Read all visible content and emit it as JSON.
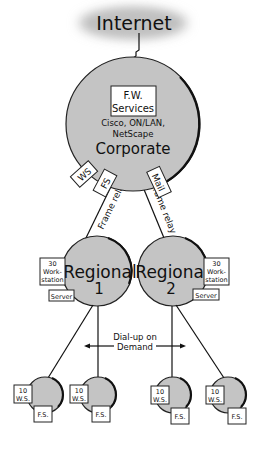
{
  "diagram": {
    "type": "network-topology",
    "colors": {
      "node_fill": "#c4c4c4",
      "cloud_fill": "#bdbdbd",
      "line": "#111111",
      "box_fill": "#ffffff"
    },
    "internet": {
      "label": "Internet"
    },
    "corporate": {
      "title": "Corporate",
      "fw_box": {
        "line1": "F.W.",
        "line2": "Services"
      },
      "vendors_line1": "Cisco, ON/LAN,",
      "vendors_line2": "NetScape",
      "tags": [
        {
          "label": "WS"
        },
        {
          "label": "FS"
        },
        {
          "label": "Mail"
        }
      ]
    },
    "links": {
      "left": {
        "label": "Frame relay"
      },
      "right": {
        "label": "Frame relay"
      }
    },
    "regionals": [
      {
        "title": "Regional",
        "number": "1",
        "ws_box": {
          "line1": "30",
          "line2": "Work-",
          "line3": "station"
        },
        "server_box": {
          "label": "Server"
        }
      },
      {
        "title": "Regional",
        "number": "2",
        "ws_box": {
          "line1": "30",
          "line2": "Work-",
          "line3": "station"
        },
        "server_box": {
          "label": "Server"
        }
      }
    ],
    "dialup": {
      "line1": "Dial-up on",
      "line2": "Demand"
    },
    "branches": [
      {
        "ws_line1": "10",
        "ws_line2": "W.S.",
        "fs_label": "F.S."
      },
      {
        "ws_line1": "10",
        "ws_line2": "W.S.",
        "fs_label": "F.S."
      },
      {
        "ws_line1": "10",
        "ws_line2": "W.S.",
        "fs_label": "F.S."
      },
      {
        "ws_line1": "10",
        "ws_line2": "W.S.",
        "fs_label": "F.S."
      }
    ]
  }
}
